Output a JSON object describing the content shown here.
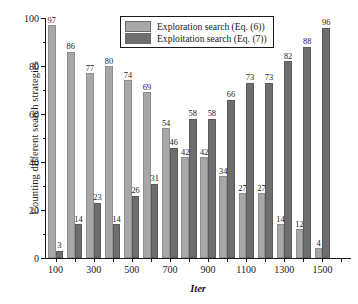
{
  "chart_data": {
    "type": "bar",
    "title": "",
    "xlabel": "Iter",
    "ylabel": "Counting different search strategies",
    "ylim": [
      0,
      100
    ],
    "yticks": [
      0,
      20,
      40,
      60,
      80,
      100
    ],
    "yticks_minor": [
      10,
      30,
      50,
      70,
      90
    ],
    "grid": false,
    "legend_position": "top-center",
    "categories": [
      100,
      200,
      300,
      400,
      500,
      600,
      700,
      800,
      900,
      1000,
      1100,
      1200,
      1300,
      1400,
      1500,
      1600
    ],
    "xtick_labels": [
      "100",
      "300",
      "500",
      "700",
      "900",
      "1100",
      "1300",
      "1500"
    ],
    "xtick_label_indices": [
      0,
      2,
      4,
      6,
      8,
      10,
      12,
      14
    ],
    "series": [
      {
        "name": "Exploration search (Eq. (6))",
        "color": "#a8a8a8",
        "values": [
          97,
          86,
          77,
          80,
          74,
          69,
          54,
          42,
          42,
          34,
          27,
          27,
          14,
          12,
          4,
          0
        ]
      },
      {
        "name": "Exploitation search (Eq. (7))",
        "color": "#6e6e6e",
        "values": [
          3,
          14,
          23,
          14,
          26,
          31,
          46,
          58,
          58,
          66,
          73,
          73,
          82,
          88,
          96,
          0
        ]
      }
    ],
    "bar_sequence": [
      {
        "group": 0,
        "series": 0,
        "value": 97
      },
      {
        "group": 0,
        "series": 1,
        "value": 3
      },
      {
        "group": 1,
        "series": 0,
        "value": 86
      },
      {
        "group": 1,
        "series": 1,
        "value": 14
      },
      {
        "group": 2,
        "series": 0,
        "value": 77
      },
      {
        "group": 2,
        "series": 1,
        "value": 23
      },
      {
        "group": 3,
        "series": 0,
        "value": 80
      },
      {
        "group": 3,
        "series": 1,
        "value": 14
      },
      {
        "group": 4,
        "series": 0,
        "value": 74
      },
      {
        "group": 4,
        "series": 1,
        "value": 26
      },
      {
        "group": 5,
        "series": 0,
        "value": 69
      },
      {
        "group": 5,
        "series": 1,
        "value": 31
      },
      {
        "group": 6,
        "series": 0,
        "value": 54
      },
      {
        "group": 6,
        "series": 1,
        "value": 46
      },
      {
        "group": 7,
        "series": 0,
        "value": 42
      },
      {
        "group": 7,
        "series": 1,
        "value": 58
      },
      {
        "group": 8,
        "series": 0,
        "value": 42
      },
      {
        "group": 8,
        "series": 1,
        "value": 58
      },
      {
        "group": 9,
        "series": 0,
        "value": 34
      },
      {
        "group": 9,
        "series": 1,
        "value": 66
      },
      {
        "group": 10,
        "series": 0,
        "value": 27
      },
      {
        "group": 10,
        "series": 1,
        "value": 73
      },
      {
        "group": 11,
        "series": 0,
        "value": 27
      },
      {
        "group": 11,
        "series": 1,
        "value": 73
      },
      {
        "group": 12,
        "series": 0,
        "value": 14
      },
      {
        "group": 12,
        "series": 1,
        "value": 82
      },
      {
        "group": 13,
        "series": 0,
        "value": 12
      },
      {
        "group": 13,
        "series": 1,
        "value": 88
      },
      {
        "group": 14,
        "series": 0,
        "value": 4
      },
      {
        "group": 14,
        "series": 1,
        "value": 96
      }
    ]
  },
  "legend": {
    "entries": [
      {
        "label": "Exploration search (Eq. (6))",
        "color": "#a8a8a8"
      },
      {
        "label": "Exploitation search (Eq. (7))",
        "color": "#6e6e6e"
      }
    ]
  },
  "axes": {
    "x_title": "Iter",
    "y_title": "Counting different search strategies"
  },
  "colors": {
    "exploration": "#a8a8a8",
    "exploitation": "#6e6e6e",
    "axis": "#1a1a1a",
    "background": "#ffffff"
  }
}
